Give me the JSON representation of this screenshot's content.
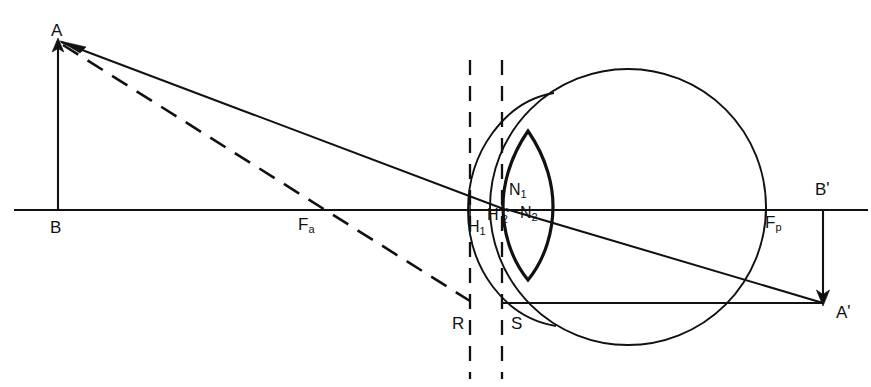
{
  "figure": {
    "type": "optical-ray-diagram",
    "background_color": "#ffffff",
    "line_color": "#111111",
    "width": 871,
    "height": 387
  },
  "labels": [
    {
      "id": "A",
      "text": "A",
      "sub": "",
      "prime": "",
      "x": 51,
      "y": 22,
      "name": "label-object-top-A"
    },
    {
      "id": "B",
      "text": "B",
      "sub": "",
      "prime": "",
      "x": 50,
      "y": 219,
      "name": "label-object-base-B"
    },
    {
      "id": "Fa",
      "text": "F",
      "sub": "a",
      "prime": "",
      "x": 298,
      "y": 216,
      "name": "label-anterior-focal-point-Fa"
    },
    {
      "id": "H1",
      "text": "H",
      "sub": "1",
      "prime": "",
      "x": 468,
      "y": 219,
      "name": "label-principal-point-H1"
    },
    {
      "id": "H2",
      "text": "H",
      "sub": "2",
      "prime": "'",
      "x": 487,
      "y": 205,
      "name": "label-principal-point-H2-prime"
    },
    {
      "id": "N1",
      "text": "N",
      "sub": "1",
      "prime": "",
      "x": 509,
      "y": 182,
      "name": "label-nodal-point-N1"
    },
    {
      "id": "N2",
      "text": "N",
      "sub": "2",
      "prime": "",
      "x": 520,
      "y": 205,
      "name": "label-nodal-point-N2"
    },
    {
      "id": "Fp",
      "text": "F",
      "sub": "p",
      "prime": "",
      "x": 765,
      "y": 214,
      "name": "label-posterior-focal-point-Fp"
    },
    {
      "id": "Bp",
      "text": "B",
      "sub": "",
      "prime": "'",
      "x": 815,
      "y": 180,
      "name": "label-image-base-B-prime"
    },
    {
      "id": "Ap",
      "text": "A",
      "sub": "",
      "prime": "'",
      "x": 836,
      "y": 303,
      "name": "label-image-top-A-prime"
    },
    {
      "id": "R",
      "text": "R",
      "sub": "",
      "prime": "",
      "x": 452,
      "y": 315,
      "name": "label-point-R"
    },
    {
      "id": "S",
      "text": "S",
      "sub": "",
      "prime": "",
      "x": 511,
      "y": 315,
      "name": "label-point-S"
    }
  ],
  "geometry": {
    "optical_axis": {
      "x1": 14,
      "y1": 210,
      "x2": 868,
      "y2": 210
    },
    "object_arrow": {
      "x1": 58,
      "y1": 210,
      "x2": 58,
      "y2": 40
    },
    "image_arrow": {
      "x1": 823,
      "y1": 210,
      "x2": 823,
      "y2": 303
    },
    "ray_solid_from_A": {
      "x1": 60,
      "y1": 41,
      "x2": 508,
      "y2": 210
    },
    "ray_solid_to_image": {
      "x1": 508,
      "y1": 210,
      "x2": 822,
      "y2": 303
    },
    "ray_dashed_from_A": {
      "x1": 62,
      "y1": 44,
      "x2": 470,
      "y2": 300
    },
    "horizontal_from_S": {
      "x1": 504,
      "y1": 303,
      "x2": 822,
      "y2": 303
    },
    "dashed_vertical_R": {
      "x": 470,
      "y1": 60,
      "y2": 378
    },
    "dashed_vertical_S": {
      "x": 502,
      "y1": 60,
      "y2": 378
    },
    "eyeball_circle": {
      "cx": 628,
      "cy": 207,
      "r": 138
    },
    "cornea_apex": {
      "x": 468,
      "y": 210
    },
    "lens": {
      "cx": 528,
      "cy": 206,
      "half_width": 25,
      "top_y": 131,
      "bottom_y": 280
    }
  },
  "annotations": {
    "title": "",
    "caption": ""
  }
}
